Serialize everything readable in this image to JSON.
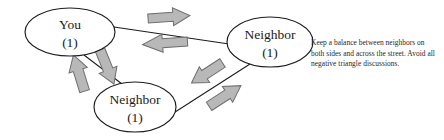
{
  "diagram": {
    "nodes": [
      {
        "id": "you",
        "label": "You",
        "count": "(1)",
        "cx": 70,
        "cy": 32,
        "rx": 45,
        "ry": 24
      },
      {
        "id": "neighbor-right",
        "label": "Neighbor",
        "count": "(1)",
        "cx": 270,
        "cy": 42,
        "rx": 43,
        "ry": 25
      },
      {
        "id": "neighbor-bottom",
        "label": "Neighbor",
        "count": "(1)",
        "cx": 135,
        "cy": 107,
        "rx": 41,
        "ry": 25
      }
    ],
    "edges": [
      {
        "id": "you-to-neighbor-right",
        "from": "you",
        "to": "neighbor-right",
        "x1": 114,
        "y1": 27,
        "x2": 229,
        "y2": 44
      },
      {
        "id": "you-to-neighbor-bottom",
        "from": "you",
        "to": "neighbor-bottom",
        "x1": 84,
        "y1": 55,
        "x2": 122,
        "y2": 84
      },
      {
        "id": "neighbor-bottom-to-neighbor-right",
        "from": "neighbor-bottom",
        "to": "neighbor-right",
        "x1": 172,
        "y1": 114,
        "x2": 248,
        "y2": 64
      }
    ],
    "arrows": [
      {
        "id": "arrow-you-to-right",
        "direction": "right",
        "cx": 169,
        "cy": 17,
        "length": 42,
        "thickness": 15,
        "rotation": -4
      },
      {
        "id": "arrow-right-to-you",
        "direction": "left",
        "cx": 165,
        "cy": 43,
        "length": 45,
        "thickness": 15,
        "rotation": -4
      },
      {
        "id": "arrow-bottom-to-you",
        "direction": "up-left",
        "cx": 79,
        "cy": 73,
        "length": 38,
        "thickness": 16,
        "rotation": -15
      },
      {
        "id": "arrow-you-to-bottom",
        "direction": "down-right",
        "cx": 107,
        "cy": 67,
        "length": 37,
        "thickness": 16,
        "rotation": 15
      },
      {
        "id": "arrow-right-to-bottom",
        "direction": "down-left",
        "cx": 207,
        "cy": 73,
        "length": 37,
        "thickness": 16,
        "rotation": -33
      },
      {
        "id": "arrow-bottom-to-right",
        "direction": "up-right",
        "cx": 225,
        "cy": 96,
        "length": 38,
        "thickness": 16,
        "rotation": -33
      }
    ],
    "colors": {
      "arrow_fill": "#b8b8b8",
      "arrow_stroke": "#6e6e6e",
      "node_stroke": "#1c1c1c",
      "background": "#ffffff",
      "text": "#1a1a1a"
    }
  },
  "caption": {
    "text": "Keep a balance between neighbors on both sides and across the street. Avoid all negative triangle discussions."
  }
}
